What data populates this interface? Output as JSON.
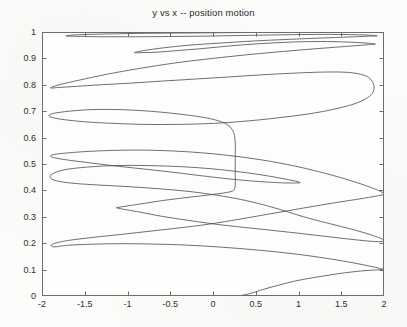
{
  "chart_data": {
    "type": "line",
    "title": "y vs x -- position motion",
    "xlabel": "",
    "ylabel": "",
    "xlim": [
      -2,
      2
    ],
    "ylim": [
      0,
      1
    ],
    "grid": false,
    "legend": null,
    "line_color": "#4a4a4a",
    "background_color": "#fdfdfb",
    "axis_color": "#6d6d6d",
    "xticks": [
      "-2",
      "-1.5",
      "-1",
      "-0.5",
      "0",
      "0.5",
      "1",
      "1.5",
      "2"
    ],
    "xtick_values": [
      -2,
      -1.5,
      -1,
      -0.5,
      0,
      0.5,
      1,
      1.5,
      2
    ],
    "yticks": [
      "0",
      "0.1",
      "0.2",
      "0.3",
      "0.4",
      "0.5",
      "0.6",
      "0.7",
      "0.8",
      "0.9",
      "1"
    ],
    "ytick_values": [
      0,
      0.1,
      0.2,
      0.3,
      0.4,
      0.5,
      0.6,
      0.7,
      0.8,
      0.9,
      1
    ],
    "series": [
      {
        "name": "position trajectory",
        "points_xy": [
          [
            0.3,
            0.0
          ],
          [
            0.36,
            0.004
          ],
          [
            0.44,
            0.01
          ],
          [
            0.52,
            0.018
          ],
          [
            0.62,
            0.028
          ],
          [
            0.78,
            0.042
          ],
          [
            0.98,
            0.058
          ],
          [
            1.22,
            0.072
          ],
          [
            1.5,
            0.086
          ],
          [
            1.74,
            0.095
          ],
          [
            1.92,
            0.099
          ],
          [
            2.0,
            0.1
          ],
          [
            1.96,
            0.104
          ],
          [
            1.82,
            0.114
          ],
          [
            1.6,
            0.128
          ],
          [
            1.3,
            0.144
          ],
          [
            0.94,
            0.16
          ],
          [
            0.52,
            0.174
          ],
          [
            0.1,
            0.185
          ],
          [
            -0.32,
            0.193
          ],
          [
            -0.74,
            0.197
          ],
          [
            -1.12,
            0.198
          ],
          [
            -1.44,
            0.196
          ],
          [
            -1.7,
            0.192
          ],
          [
            -1.86,
            0.186
          ],
          [
            -1.88,
            0.196
          ],
          [
            -1.7,
            0.21
          ],
          [
            -1.4,
            0.222
          ],
          [
            -1.0,
            0.236
          ],
          [
            -0.56,
            0.252
          ],
          [
            -0.14,
            0.268
          ],
          [
            0.22,
            0.286
          ],
          [
            0.54,
            0.304
          ],
          [
            0.86,
            0.322
          ],
          [
            1.18,
            0.34
          ],
          [
            1.48,
            0.356
          ],
          [
            1.72,
            0.368
          ],
          [
            1.9,
            0.378
          ],
          [
            2.0,
            0.386
          ],
          [
            1.96,
            0.396
          ],
          [
            1.84,
            0.412
          ],
          [
            1.62,
            0.436
          ],
          [
            1.32,
            0.464
          ],
          [
            0.96,
            0.492
          ],
          [
            0.56,
            0.516
          ],
          [
            0.14,
            0.534
          ],
          [
            -0.28,
            0.546
          ],
          [
            -0.7,
            0.552
          ],
          [
            -1.1,
            0.552
          ],
          [
            -1.44,
            0.548
          ],
          [
            -1.7,
            0.542
          ],
          [
            -1.86,
            0.536
          ],
          [
            -1.9,
            0.53
          ],
          [
            -1.86,
            0.524
          ],
          [
            -1.72,
            0.516
          ],
          [
            -1.48,
            0.506
          ],
          [
            -1.18,
            0.494
          ],
          [
            -0.84,
            0.482
          ],
          [
            -0.5,
            0.47
          ],
          [
            -0.2,
            0.458
          ],
          [
            0.06,
            0.448
          ],
          [
            0.3,
            0.44
          ],
          [
            0.52,
            0.434
          ],
          [
            0.72,
            0.43
          ],
          [
            0.9,
            0.428
          ],
          [
            1.02,
            0.43
          ],
          [
            0.86,
            0.442
          ],
          [
            0.62,
            0.456
          ],
          [
            0.32,
            0.47
          ],
          [
            -0.02,
            0.482
          ],
          [
            -0.38,
            0.49
          ],
          [
            -0.76,
            0.494
          ],
          [
            -1.14,
            0.494
          ],
          [
            -1.48,
            0.488
          ],
          [
            -1.74,
            0.478
          ],
          [
            -1.88,
            0.462
          ],
          [
            -1.9,
            0.446
          ],
          [
            -1.8,
            0.434
          ],
          [
            -1.6,
            0.426
          ],
          [
            -1.32,
            0.42
          ],
          [
            -0.98,
            0.414
          ],
          [
            -0.62,
            0.406
          ],
          [
            -0.28,
            0.396
          ],
          [
            0.04,
            0.382
          ],
          [
            0.32,
            0.366
          ],
          [
            0.56,
            0.348
          ],
          [
            0.76,
            0.33
          ],
          [
            0.92,
            0.314
          ],
          [
            1.06,
            0.3
          ],
          [
            1.22,
            0.286
          ],
          [
            1.44,
            0.268
          ],
          [
            1.68,
            0.248
          ],
          [
            1.88,
            0.228
          ],
          [
            2.0,
            0.212
          ],
          [
            1.96,
            0.206
          ],
          [
            1.82,
            0.208
          ],
          [
            1.58,
            0.216
          ],
          [
            1.26,
            0.228
          ],
          [
            0.88,
            0.242
          ],
          [
            0.48,
            0.256
          ],
          [
            0.08,
            0.27
          ],
          [
            -0.28,
            0.286
          ],
          [
            -0.6,
            0.302
          ],
          [
            -0.86,
            0.318
          ],
          [
            -1.1,
            0.332
          ],
          [
            -1.1,
            0.336
          ],
          [
            -0.86,
            0.348
          ],
          [
            -0.58,
            0.362
          ],
          [
            -0.28,
            0.374
          ],
          [
            -0.02,
            0.384
          ],
          [
            0.16,
            0.392
          ],
          [
            0.24,
            0.4
          ],
          [
            0.26,
            0.42
          ],
          [
            0.26,
            0.46
          ],
          [
            0.26,
            0.52
          ],
          [
            0.26,
            0.58
          ],
          [
            0.24,
            0.62
          ],
          [
            0.18,
            0.646
          ],
          [
            0.06,
            0.664
          ],
          [
            -0.14,
            0.678
          ],
          [
            -0.42,
            0.69
          ],
          [
            -0.74,
            0.7
          ],
          [
            -1.08,
            0.706
          ],
          [
            -1.42,
            0.706
          ],
          [
            -1.68,
            0.7
          ],
          [
            -1.86,
            0.692
          ],
          [
            -1.92,
            0.684
          ],
          [
            -1.88,
            0.676
          ],
          [
            -1.74,
            0.668
          ],
          [
            -1.5,
            0.66
          ],
          [
            -1.18,
            0.654
          ],
          [
            -0.8,
            0.65
          ],
          [
            -0.4,
            0.65
          ],
          [
            0.02,
            0.654
          ],
          [
            0.44,
            0.664
          ],
          [
            0.84,
            0.678
          ],
          [
            1.2,
            0.694
          ],
          [
            1.5,
            0.714
          ],
          [
            1.72,
            0.736
          ],
          [
            1.86,
            0.766
          ],
          [
            1.88,
            0.8
          ],
          [
            1.82,
            0.828
          ],
          [
            1.7,
            0.842
          ],
          [
            1.52,
            0.848
          ],
          [
            1.26,
            0.848
          ],
          [
            0.94,
            0.844
          ],
          [
            0.58,
            0.838
          ],
          [
            0.2,
            0.83
          ],
          [
            -0.2,
            0.822
          ],
          [
            -0.6,
            0.814
          ],
          [
            -0.98,
            0.806
          ],
          [
            -1.32,
            0.8
          ],
          [
            -1.6,
            0.794
          ],
          [
            -1.8,
            0.79
          ],
          [
            -1.9,
            0.788
          ],
          [
            -1.8,
            0.8
          ],
          [
            -1.56,
            0.818
          ],
          [
            -1.24,
            0.84
          ],
          [
            -0.86,
            0.862
          ],
          [
            -0.46,
            0.882
          ],
          [
            -0.06,
            0.898
          ],
          [
            0.34,
            0.912
          ],
          [
            0.74,
            0.924
          ],
          [
            1.1,
            0.934
          ],
          [
            1.42,
            0.942
          ],
          [
            1.66,
            0.948
          ],
          [
            1.82,
            0.952
          ],
          [
            1.9,
            0.954
          ],
          [
            1.8,
            0.958
          ],
          [
            1.56,
            0.962
          ],
          [
            1.26,
            0.964
          ],
          [
            0.92,
            0.962
          ],
          [
            0.56,
            0.956
          ],
          [
            0.22,
            0.948
          ],
          [
            -0.1,
            0.938
          ],
          [
            -0.4,
            0.93
          ],
          [
            -0.64,
            0.924
          ],
          [
            -0.82,
            0.922
          ],
          [
            -0.92,
            0.922
          ],
          [
            -0.8,
            0.93
          ],
          [
            -0.58,
            0.94
          ],
          [
            -0.28,
            0.95
          ],
          [
            0.08,
            0.958
          ],
          [
            0.48,
            0.966
          ],
          [
            0.88,
            0.972
          ],
          [
            1.26,
            0.977
          ],
          [
            1.58,
            0.981
          ],
          [
            1.8,
            0.984
          ],
          [
            1.92,
            0.985
          ],
          [
            1.84,
            0.988
          ],
          [
            1.62,
            0.99
          ],
          [
            1.3,
            0.991
          ],
          [
            0.94,
            0.99
          ],
          [
            0.56,
            0.988
          ],
          [
            0.18,
            0.986
          ],
          [
            -0.18,
            0.984
          ],
          [
            -0.52,
            0.983
          ],
          [
            -0.84,
            0.982
          ],
          [
            -1.1,
            0.982
          ],
          [
            -1.32,
            0.982
          ],
          [
            -1.5,
            0.983
          ],
          [
            -1.64,
            0.984
          ],
          [
            -1.72,
            0.985
          ],
          [
            -1.66,
            0.988
          ],
          [
            -1.46,
            0.991
          ],
          [
            -1.16,
            0.993
          ],
          [
            -0.8,
            0.995
          ],
          [
            -0.4,
            0.996
          ],
          [
            0.0,
            0.997
          ],
          [
            0.42,
            0.998
          ],
          [
            0.84,
            0.998
          ],
          [
            1.22,
            0.999
          ],
          [
            1.54,
            0.999
          ],
          [
            1.78,
            1.0
          ],
          [
            1.92,
            1.0
          ],
          [
            1.76,
            1.0
          ],
          [
            1.44,
            1.0
          ],
          [
            1.06,
            1.0
          ],
          [
            0.66,
            1.0
          ],
          [
            0.24,
            1.0
          ],
          [
            -0.18,
            1.0
          ],
          [
            -0.58,
            1.0
          ],
          [
            -0.96,
            1.0
          ],
          [
            -1.28,
            1.0
          ],
          [
            -1.54,
            1.0
          ],
          [
            -1.7,
            1.0
          ]
        ]
      }
    ]
  }
}
